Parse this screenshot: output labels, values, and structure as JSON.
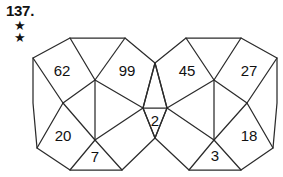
{
  "header": {
    "problem_number": "137.",
    "difficulty_stars": [
      "★",
      "★"
    ],
    "star_count": 2
  },
  "puzzle": {
    "type": "pentagonal-tiling-number-puzzle",
    "stroke_color": "#2b2b2b",
    "text_color": "#111111",
    "background_color": "#ffffff",
    "cells": [
      {
        "name": "cell-62",
        "label": "62",
        "x": 62,
        "y": 72
      },
      {
        "name": "cell-99",
        "label": "99",
        "x": 127,
        "y": 72
      },
      {
        "name": "cell-45",
        "label": "45",
        "x": 187,
        "y": 72
      },
      {
        "name": "cell-27",
        "label": "27",
        "x": 249,
        "y": 72
      },
      {
        "name": "cell-2",
        "label": "2",
        "x": 155,
        "y": 120
      },
      {
        "name": "cell-20",
        "label": "20",
        "x": 63,
        "y": 137
      },
      {
        "name": "cell-7",
        "label": "7",
        "x": 95,
        "y": 158
      },
      {
        "name": "cell-3",
        "label": "3",
        "x": 215,
        "y": 157
      },
      {
        "name": "cell-18",
        "label": "18",
        "x": 249,
        "y": 137
      }
    ]
  }
}
